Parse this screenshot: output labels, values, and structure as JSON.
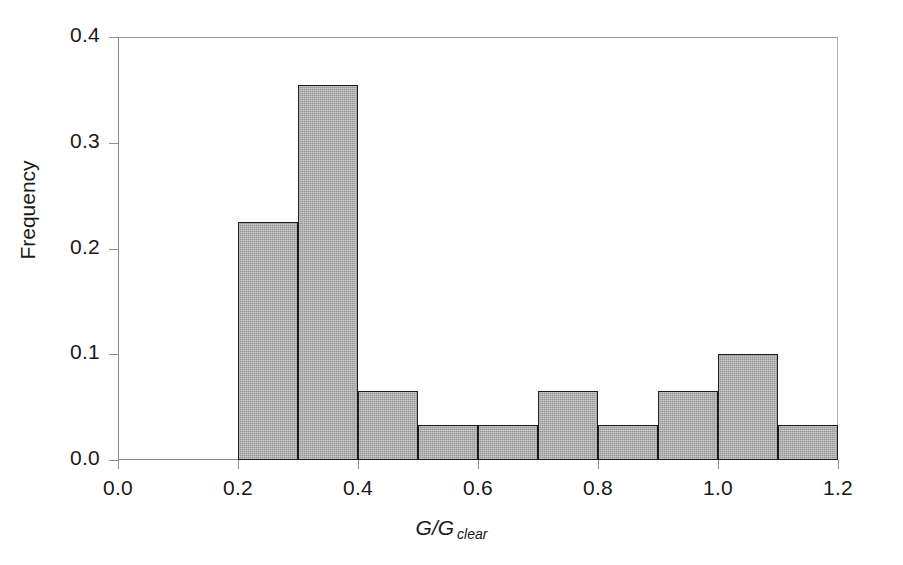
{
  "chart_data": {
    "type": "bar",
    "title": "",
    "subtitle": "",
    "xlabel": "G/G clear",
    "xlabel_main": "G/G",
    "xlabel_sub": "clear",
    "ylabel": "Frequency",
    "xlim": [
      0.0,
      1.2
    ],
    "ylim": [
      0.0,
      0.4
    ],
    "grid": false,
    "legend": null,
    "bin_width": 0.1,
    "bin_edges": [
      0.2,
      0.3,
      0.4,
      0.5,
      0.6,
      0.7,
      0.8,
      0.9,
      1.0,
      1.1,
      1.2
    ],
    "categories": [
      "0.2-0.3",
      "0.3-0.4",
      "0.4-0.5",
      "0.5-0.6",
      "0.6-0.7",
      "0.7-0.8",
      "0.8-0.9",
      "0.9-1.0",
      "1.0-1.1",
      "1.1-1.2"
    ],
    "values": [
      0.225,
      0.355,
      0.065,
      0.033,
      0.033,
      0.065,
      0.033,
      0.065,
      0.1,
      0.033
    ],
    "bars": [
      {
        "x0": 0.2,
        "x1": 0.3,
        "value": 0.225
      },
      {
        "x0": 0.3,
        "x1": 0.4,
        "value": 0.355
      },
      {
        "x0": 0.4,
        "x1": 0.5,
        "value": 0.065
      },
      {
        "x0": 0.5,
        "x1": 0.6,
        "value": 0.033
      },
      {
        "x0": 0.6,
        "x1": 0.7,
        "value": 0.033
      },
      {
        "x0": 0.7,
        "x1": 0.8,
        "value": 0.065
      },
      {
        "x0": 0.8,
        "x1": 0.9,
        "value": 0.033
      },
      {
        "x0": 0.9,
        "x1": 1.0,
        "value": 0.065
      },
      {
        "x0": 1.0,
        "x1": 1.1,
        "value": 0.1
      },
      {
        "x0": 1.1,
        "x1": 1.2,
        "value": 0.033
      }
    ],
    "yticks": [
      {
        "value": 0.0,
        "label": "0.0"
      },
      {
        "value": 0.1,
        "label": "0.1"
      },
      {
        "value": 0.2,
        "label": "0.2"
      },
      {
        "value": 0.3,
        "label": "0.3"
      },
      {
        "value": 0.4,
        "label": "0.4"
      }
    ],
    "xticks": [
      {
        "value": 0.0,
        "label": "0.0"
      },
      {
        "value": 0.2,
        "label": "0.2"
      },
      {
        "value": 0.4,
        "label": "0.4"
      },
      {
        "value": 0.6,
        "label": "0.6"
      },
      {
        "value": 0.8,
        "label": "0.8"
      },
      {
        "value": 1.0,
        "label": "1.0"
      },
      {
        "value": 1.2,
        "label": "1.2"
      }
    ],
    "colors": {
      "bar_fill": "#a9a9a9",
      "bar_edge": "#1c1c1c",
      "axis": "#8e8e8e",
      "text": "#1a1a1a",
      "background": "#ffffff"
    }
  }
}
